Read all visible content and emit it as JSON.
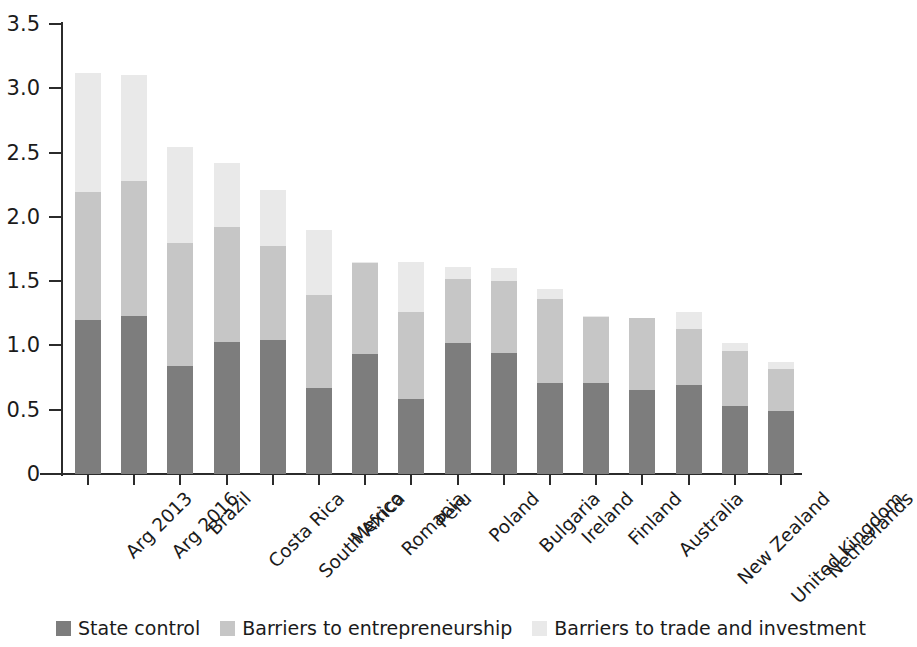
{
  "chart_data": {
    "type": "bar",
    "subtype": "stacked-bar-vertical",
    "title": "",
    "subtitle": "",
    "xlabel": "",
    "ylabel": "",
    "ylim": [
      0,
      3.5
    ],
    "ytick_labels": [
      "0",
      "0.5",
      "1.0",
      "1.5",
      "2.0",
      "2.5",
      "3.0",
      "3.5"
    ],
    "ytick_values": [
      0,
      0.5,
      1.0,
      1.5,
      2.0,
      2.5,
      3.0,
      3.5
    ],
    "grid": false,
    "legend_position": "bottom-left",
    "categories": [
      "Arg 2013",
      "Arg 2016",
      "Brazil",
      "Costa Rica",
      "South Africa",
      "Mexico",
      "Romania",
      "Peru",
      "Poland",
      "Bulgaria",
      "Ireland",
      "Finland",
      "Australia",
      "New Zealand",
      "United Kingdom",
      "Netherlands"
    ],
    "series": [
      {
        "name": "State control",
        "color": "#7d7d7d",
        "values": [
          1.2,
          1.23,
          0.84,
          1.03,
          1.04,
          0.67,
          0.93,
          0.58,
          1.02,
          0.94,
          0.71,
          0.71,
          0.65,
          0.69,
          0.53,
          0.49
        ]
      },
      {
        "name": "Barriers to entrepreneurship",
        "color": "#c6c6c6",
        "values": [
          0.99,
          1.05,
          0.96,
          0.89,
          0.73,
          0.72,
          0.71,
          0.68,
          0.5,
          0.56,
          0.65,
          0.51,
          0.56,
          0.44,
          0.43,
          0.33
        ]
      },
      {
        "name": "Barriers to trade and investment",
        "color": "#e9e9e9",
        "values": [
          0.93,
          0.82,
          0.74,
          0.5,
          0.44,
          0.51,
          0.01,
          0.39,
          0.09,
          0.1,
          0.08,
          0.01,
          0.0,
          0.13,
          0.06,
          0.05
        ]
      }
    ],
    "totals": [
      3.12,
      3.1,
      2.54,
      2.42,
      2.21,
      1.9,
      1.65,
      1.65,
      1.61,
      1.6,
      1.44,
      1.23,
      1.21,
      1.26,
      1.02,
      0.87
    ]
  },
  "legend": {
    "items": [
      {
        "label": "State control",
        "color": "#7d7d7d"
      },
      {
        "label": "Barriers to entrepreneurship",
        "color": "#c6c6c6"
      },
      {
        "label": "Barriers to trade and investment",
        "color": "#e9e9e9"
      }
    ]
  }
}
